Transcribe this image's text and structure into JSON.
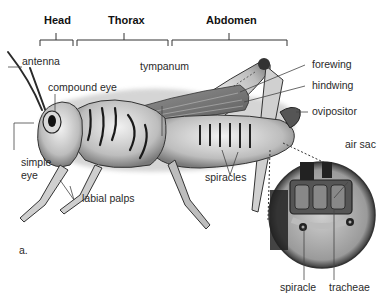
{
  "figure": {
    "panel_label": "a.",
    "regions": [
      {
        "label": "Head"
      },
      {
        "label": "Thorax"
      },
      {
        "label": "Abdomen"
      }
    ],
    "labels": {
      "antenna": "antenna",
      "compound_eye": "compound eye",
      "simple_eye_line1": "simple",
      "simple_eye_line2": "eye",
      "labial_palps": "labial palps",
      "tympanum": "tympanum",
      "forewing": "forewing",
      "hindwing": "hindwing",
      "ovipositor": "ovipositor",
      "spiracles": "spiracles",
      "air_sac": "air sac",
      "spiracle": "spiracle",
      "tracheae": "tracheae"
    }
  }
}
